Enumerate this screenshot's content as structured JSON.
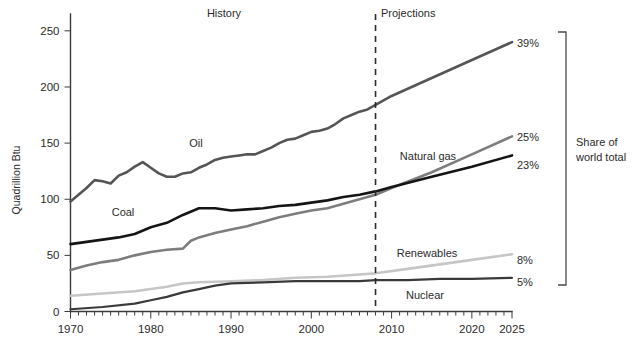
{
  "chart_data": {
    "type": "line",
    "title": "",
    "xlabel": "",
    "ylabel": "Quadrillion Btu",
    "xlim": [
      1970,
      2025
    ],
    "ylim": [
      0,
      265
    ],
    "y_ticks": [
      0,
      50,
      100,
      150,
      200,
      250
    ],
    "y_tick_labels": [
      "0",
      "50",
      "100",
      "150",
      "200",
      "250"
    ],
    "x_ticks": [
      1970,
      1980,
      1990,
      2000,
      2010,
      2020,
      2025
    ],
    "x_tick_labels": [
      "1970",
      "1980",
      "1990",
      "2000",
      "2010",
      "2020",
      "2025"
    ],
    "minor_x_tick_interval": 1,
    "grid": false,
    "legend": "inline-series-labels",
    "annotations": {
      "history_label": "History",
      "projections_label": "Projections",
      "divider_year": 2008,
      "bracket_label": "Share of world total",
      "bracket_label_line1": "Share of",
      "bracket_label_line2": "world total"
    },
    "series": [
      {
        "name": "Oil",
        "label": "Oil",
        "end_share_label": "39%",
        "color": "#555555",
        "stroke_width": 2.6,
        "x": [
          1970,
          1971,
          1972,
          1973,
          1974,
          1975,
          1976,
          1977,
          1978,
          1979,
          1980,
          1981,
          1982,
          1983,
          1984,
          1985,
          1986,
          1987,
          1988,
          1989,
          1990,
          1991,
          1992,
          1993,
          1994,
          1995,
          1996,
          1997,
          1998,
          1999,
          2000,
          2001,
          2002,
          2003,
          2004,
          2005,
          2006,
          2007,
          2008,
          2010,
          2015,
          2020,
          2025
        ],
        "values": [
          98,
          104,
          110,
          117,
          116,
          114,
          121,
          124,
          129,
          133,
          128,
          123,
          120,
          120,
          123,
          124,
          128,
          131,
          135,
          137,
          138,
          139,
          140,
          140,
          143,
          146,
          150,
          153,
          154,
          157,
          160,
          161,
          163,
          167,
          172,
          175,
          178,
          180,
          184,
          192,
          208,
          224,
          240
        ]
      },
      {
        "name": "Natural gas",
        "label": "Natural gas",
        "end_share_label": "25%",
        "color": "#7d7d7d",
        "stroke_width": 2.6,
        "x": [
          1970,
          1972,
          1974,
          1976,
          1978,
          1980,
          1982,
          1984,
          1985,
          1986,
          1988,
          1990,
          1992,
          1994,
          1996,
          1998,
          2000,
          2002,
          2004,
          2006,
          2008,
          2010,
          2015,
          2020,
          2025
        ],
        "values": [
          37,
          41,
          44,
          46,
          50,
          53,
          55,
          56,
          63,
          66,
          70,
          73,
          76,
          80,
          84,
          87,
          90,
          92,
          96,
          100,
          104,
          110,
          124,
          140,
          156
        ]
      },
      {
        "name": "Coal",
        "label": "Coal",
        "end_share_label": "23%",
        "color": "#151515",
        "stroke_width": 2.6,
        "x": [
          1970,
          1972,
          1974,
          1976,
          1978,
          1980,
          1982,
          1984,
          1986,
          1988,
          1990,
          1992,
          1994,
          1996,
          1998,
          2000,
          2002,
          2004,
          2006,
          2008,
          2010,
          2015,
          2020,
          2025
        ],
        "values": [
          60,
          62,
          64,
          66,
          69,
          75,
          79,
          86,
          92,
          92,
          90,
          91,
          92,
          94,
          95,
          97,
          99,
          102,
          104,
          107,
          111,
          120,
          129,
          139
        ]
      },
      {
        "name": "Renewables",
        "label": "Renewables",
        "end_share_label": "8%",
        "color": "#c6c6c6",
        "stroke_width": 2.6,
        "x": [
          1970,
          1974,
          1978,
          1980,
          1982,
          1984,
          1986,
          1990,
          1994,
          1998,
          2002,
          2006,
          2008,
          2012,
          2016,
          2020,
          2025
        ],
        "values": [
          14,
          16,
          18,
          20,
          22,
          25,
          26,
          27,
          28,
          30,
          31,
          33,
          34,
          38,
          42,
          46,
          51
        ]
      },
      {
        "name": "Nuclear",
        "label": "Nuclear",
        "end_share_label": "5%",
        "color": "#3a3a3a",
        "stroke_width": 2.2,
        "x": [
          1970,
          1974,
          1978,
          1980,
          1982,
          1984,
          1986,
          1988,
          1990,
          1994,
          1998,
          2002,
          2006,
          2008,
          2012,
          2016,
          2020,
          2025
        ],
        "values": [
          2,
          4,
          7,
          10,
          13,
          17,
          20,
          23,
          25,
          26,
          27,
          27,
          27,
          28,
          28,
          29,
          29,
          30
        ]
      }
    ]
  }
}
